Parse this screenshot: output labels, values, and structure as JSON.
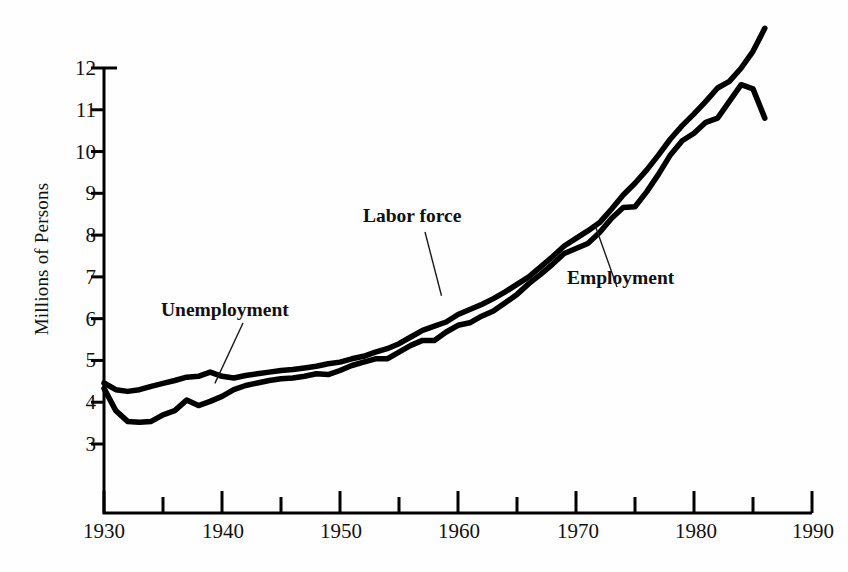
{
  "chart_data": {
    "type": "area",
    "title": "",
    "xlabel": "",
    "ylabel": "Millions of Persons",
    "xlim": [
      1930,
      1990
    ],
    "ylim": [
      1.25,
      13.2
    ],
    "grid": false,
    "legend_position": "inline-annotations",
    "x_major_ticks": [
      1930,
      1940,
      1950,
      1960,
      1970,
      1980,
      1990
    ],
    "x_minor_ticks": [
      1935,
      1945,
      1955,
      1965,
      1975,
      1985
    ],
    "y_ticks": [
      3,
      4,
      5,
      6,
      7,
      8,
      9,
      10,
      11,
      12
    ],
    "annotations": [
      {
        "label": "Unemployment",
        "target_year": 1939.4,
        "target_value": 4.45
      },
      {
        "label": "Labor force",
        "target_year": 1958.6,
        "target_value": 6.55
      },
      {
        "label": "Employment",
        "target_year": 1971.6,
        "target_value": 8.25
      }
    ],
    "x": [
      1930,
      1931,
      1932,
      1933,
      1934,
      1935,
      1936,
      1937,
      1938,
      1939,
      1940,
      1941,
      1942,
      1943,
      1944,
      1945,
      1946,
      1947,
      1948,
      1949,
      1950,
      1951,
      1952,
      1953,
      1954,
      1955,
      1956,
      1957,
      1958,
      1959,
      1960,
      1961,
      1962,
      1963,
      1964,
      1965,
      1966,
      1967,
      1968,
      1969,
      1970,
      1971,
      1972,
      1973,
      1974,
      1975,
      1976,
      1977,
      1978,
      1979,
      1980,
      1981,
      1982,
      1983,
      1984,
      1985,
      1986
    ],
    "series": [
      {
        "name": "Labor force",
        "fill_color": "#a9a9a9",
        "line_color": "#000000",
        "values": [
          4.46,
          4.3,
          4.26,
          4.3,
          4.38,
          4.45,
          4.52,
          4.6,
          4.62,
          4.72,
          4.62,
          4.58,
          4.64,
          4.68,
          4.72,
          4.76,
          4.78,
          4.82,
          4.86,
          4.92,
          4.96,
          5.04,
          5.1,
          5.2,
          5.28,
          5.4,
          5.56,
          5.72,
          5.82,
          5.92,
          6.1,
          6.22,
          6.34,
          6.48,
          6.64,
          6.82,
          7.0,
          7.24,
          7.48,
          7.74,
          7.92,
          8.1,
          8.3,
          8.62,
          8.96,
          9.24,
          9.56,
          9.92,
          10.3,
          10.62,
          10.9,
          11.2,
          11.52,
          11.68,
          12.0,
          12.4,
          12.95
        ]
      },
      {
        "name": "Employment",
        "fill_color": "#c2c2c2",
        "line_color": "#000000",
        "values": [
          4.33,
          3.8,
          3.54,
          3.52,
          3.54,
          3.7,
          3.8,
          4.05,
          3.92,
          4.02,
          4.14,
          4.3,
          4.4,
          4.46,
          4.52,
          4.56,
          4.58,
          4.62,
          4.68,
          4.66,
          4.76,
          4.88,
          4.96,
          5.04,
          5.04,
          5.2,
          5.36,
          5.48,
          5.48,
          5.68,
          5.84,
          5.9,
          6.06,
          6.18,
          6.38,
          6.58,
          6.84,
          7.06,
          7.3,
          7.56,
          7.68,
          7.8,
          8.06,
          8.4,
          8.66,
          8.68,
          9.04,
          9.46,
          9.92,
          10.26,
          10.44,
          10.7,
          10.8,
          11.2,
          11.6,
          11.5,
          10.8
        ]
      }
    ]
  },
  "axis": {
    "y_tick_labels": [
      "12",
      "11",
      "10",
      "9",
      "8",
      "7",
      "6",
      "5",
      "4",
      "3"
    ],
    "x_tick_labels": [
      "1930",
      "1940",
      "1950",
      "1960",
      "1970",
      "1980",
      "1990"
    ],
    "y_axis_title": "Millions of Persons"
  },
  "annotations": {
    "unemployment": "Unemployment",
    "labor_force": "Labor force",
    "employment": "Employment"
  },
  "colors": {
    "axis": "#000000",
    "employment_fill": "#c2c2c2",
    "unemployment_fill": "#a9a9a9",
    "line": "#000000",
    "background": "#fefefe"
  }
}
